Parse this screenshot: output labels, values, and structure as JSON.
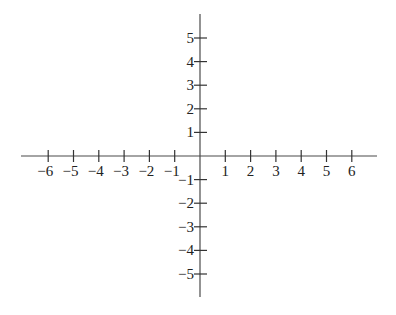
{
  "diagram": {
    "type": "coordinate-plane",
    "origin_px": [
      200,
      156
    ],
    "x_axis": {
      "from_px": 21,
      "to_px": 377,
      "unit_px": 25.3,
      "ticks": [
        -6,
        -5,
        -4,
        -3,
        -2,
        -1,
        1,
        2,
        3,
        4,
        5,
        6
      ],
      "labels": [
        "−6",
        "−5",
        "−4",
        "−3",
        "−2",
        "−1",
        "1",
        "2",
        "3",
        "4",
        "5",
        "6"
      ]
    },
    "y_axis": {
      "from_px": 14,
      "to_px": 297,
      "unit_px": 23.6,
      "ticks": [
        5,
        4,
        3,
        2,
        1,
        -1,
        -2,
        -3,
        -4,
        -5
      ],
      "labels": [
        "5",
        "4",
        "3",
        "2",
        "1",
        "−1",
        "−2",
        "−3",
        "−4",
        "−5"
      ]
    },
    "colors": {
      "axis": "#4a4a4a",
      "text": "#222222",
      "background": "#ffffff"
    }
  }
}
